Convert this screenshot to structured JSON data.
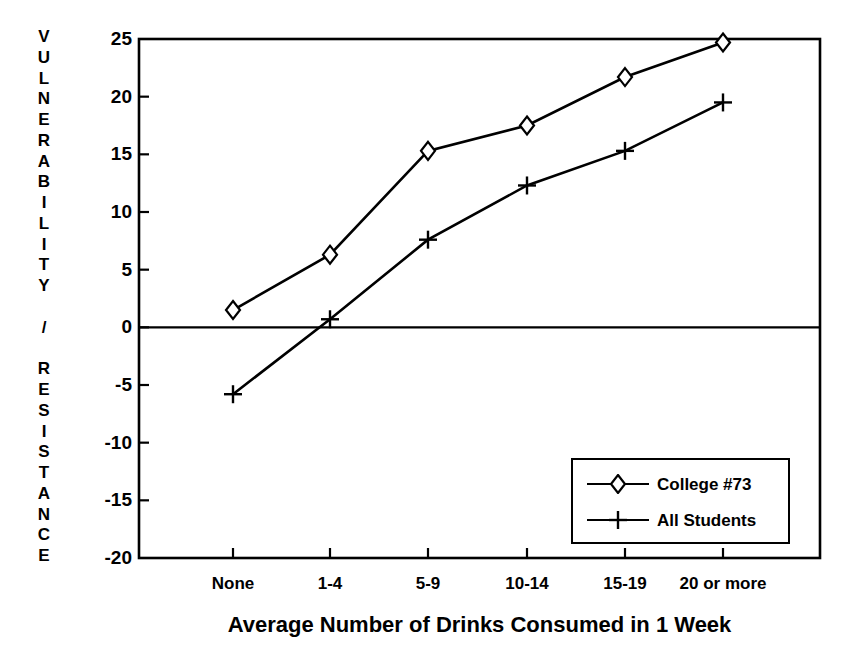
{
  "chart_data": {
    "type": "line",
    "title": "",
    "xlabel": "Average Number of Drinks Consumed in 1 Week",
    "ylabel": "VULNERABILITY / RESISTANCE",
    "categories": [
      "None",
      "1-4",
      "5-9",
      "10-14",
      "15-19",
      "20 or more"
    ],
    "ylim": [
      -20,
      25
    ],
    "yticks": [
      25,
      20,
      15,
      10,
      5,
      0,
      -5,
      -10,
      -15,
      -20
    ],
    "ytick_labels": [
      "25",
      "20",
      "15",
      "10",
      "5",
      "0",
      "-5",
      "-10",
      "-15",
      "-20"
    ],
    "grid": false,
    "legend_position": "lower right",
    "zero_line": true,
    "series": [
      {
        "name": "College #73",
        "marker": "diamond",
        "values": [
          1.5,
          6.3,
          15.3,
          17.5,
          21.7,
          24.7
        ]
      },
      {
        "name": "All Students",
        "marker": "plus",
        "values": [
          -5.8,
          0.7,
          7.6,
          12.3,
          15.3,
          19.5
        ]
      }
    ]
  },
  "ylabel_chars": [
    "V",
    "U",
    "L",
    "N",
    "E",
    "R",
    "A",
    "B",
    "I",
    "L",
    "I",
    "T",
    "Y",
    "",
    "/",
    "",
    "R",
    "E",
    "S",
    "I",
    "S",
    "T",
    "A",
    "N",
    "C",
    "E"
  ],
  "legend": {
    "entries": [
      {
        "label": "College #73",
        "marker": "diamond"
      },
      {
        "label": "All Students",
        "marker": "plus"
      }
    ]
  },
  "colors": {
    "line": "#000000",
    "axis": "#000000",
    "background": "#ffffff"
  }
}
